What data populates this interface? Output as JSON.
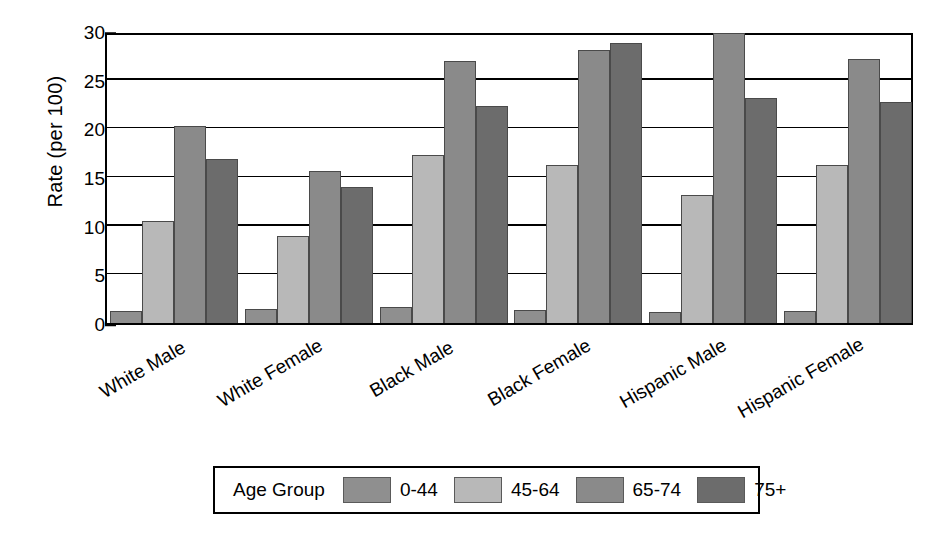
{
  "chart_data": {
    "type": "bar",
    "title": "",
    "xlabel": "",
    "ylabel": "Rate (per 100)",
    "ylim": [
      0,
      30
    ],
    "ytick_values": [
      0,
      5,
      10,
      15,
      20,
      25,
      30
    ],
    "ytick_labels": [
      "0",
      "5",
      "10",
      "15",
      "20",
      "25",
      "30"
    ],
    "yminor_interval": 1,
    "grid": "horizontal",
    "legend_position": "bottom",
    "legend_title": "Age Group",
    "categories": [
      "White Male",
      "White Female",
      "Black Male",
      "Black Female",
      "Hispanic Male",
      "Hispanic Female"
    ],
    "series": [
      {
        "name": "0-44",
        "color": "#8f8f8f",
        "values": [
          1.2,
          1.4,
          1.6,
          1.3,
          1.1,
          1.2
        ]
      },
      {
        "name": "45-64",
        "color": "#b8b8b8",
        "values": [
          10.5,
          8.9,
          17.3,
          16.2,
          13.2,
          16.2
        ]
      },
      {
        "name": "65-74",
        "color": "#8a8a8a",
        "values": [
          20.2,
          15.6,
          26.9,
          28.1,
          29.8,
          27.1
        ]
      },
      {
        "name": "75+",
        "color": "#6c6c6c",
        "values": [
          16.9,
          14.0,
          22.3,
          28.8,
          23.1,
          22.7
        ]
      }
    ]
  }
}
